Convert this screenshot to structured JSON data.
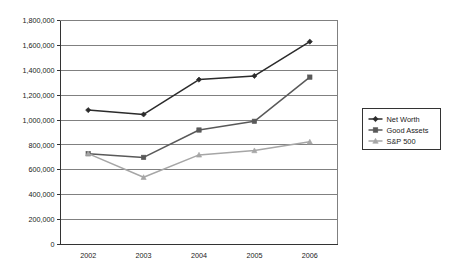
{
  "chart_data": {
    "type": "line",
    "title": "",
    "subtitle": "",
    "xlabel": "",
    "ylabel": "",
    "categories": [
      "2002",
      "2003",
      "2004",
      "2005",
      "2006"
    ],
    "series": [
      {
        "name": "Net Worth",
        "marker": "diamond",
        "color": "#2b2b2b",
        "values": [
          1080000,
          1045000,
          1325000,
          1355000,
          1630000
        ]
      },
      {
        "name": "Good Assets",
        "marker": "square",
        "color": "#595959",
        "values": [
          730000,
          700000,
          920000,
          990000,
          1345000
        ]
      },
      {
        "name": "S&P 500",
        "marker": "triangle",
        "color": "#a6a6a6",
        "values": [
          730000,
          540000,
          720000,
          755000,
          825000
        ]
      }
    ],
    "ylim": [
      0,
      1800000
    ],
    "ytick_step": 200000,
    "ytick_labels": [
      "0",
      "200,000",
      "400,000",
      "600,000",
      "800,000",
      "1,000,000",
      "1,200,000",
      "1,400,000",
      "1,600,000",
      "1,800,000"
    ],
    "grid": true,
    "grid_axis": "y",
    "legend_position": "right"
  },
  "legend": {
    "entries": [
      {
        "label": "Net Worth"
      },
      {
        "label": "Good Assets"
      },
      {
        "label": "S&P 500"
      }
    ]
  },
  "colors": {
    "net_worth": "#2b2b2b",
    "good_assets": "#595959",
    "sp500": "#a6a6a6",
    "gridline": "#808080",
    "axis": "#333333",
    "background": "#ffffff"
  }
}
